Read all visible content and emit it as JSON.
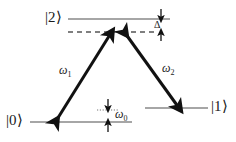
{
  "figure": {
    "type": "lambda-energy-level-diagram",
    "title": "",
    "background_color": "#ffffff",
    "ink_color": "#1a1a1a",
    "level_line_color": "#808080"
  },
  "levels": [
    {
      "id": "excited",
      "label": "|2⟩",
      "label_x": 47,
      "label_y": 11,
      "line_x1": 68,
      "line_x2": 170,
      "line_y": 19,
      "style": "solid"
    },
    {
      "id": "virtual",
      "label": "",
      "line_x1": 68,
      "line_x2": 158,
      "line_y": 32,
      "style": "dashed"
    },
    {
      "id": "ground0",
      "label": "|0⟩",
      "label_x": 7,
      "label_y": 114,
      "line_x1": 30,
      "line_x2": 132,
      "line_y": 122,
      "style": "solid"
    },
    {
      "id": "ground1",
      "label": "|1⟩",
      "label_x": 211,
      "label_y": 100,
      "line_x1": 145,
      "line_x2": 208,
      "line_y": 108,
      "style": "solid"
    },
    {
      "id": "ground0-reference",
      "label": "",
      "line_x1": 98,
      "line_x2": 118,
      "line_y": 110,
      "style": "dotted"
    }
  ],
  "transitions": [
    {
      "id": "omega1",
      "label": "ω",
      "subscript": "1",
      "label_x": 59,
      "label_y": 64,
      "from_x": 56,
      "from_y": 121,
      "to_x": 111,
      "to_y": 33,
      "arrowheads": "both",
      "width": 3
    },
    {
      "id": "omega2",
      "label": "ω",
      "subscript": "2",
      "label_x": 162,
      "label_y": 62,
      "from_x": 125,
      "from_y": 33,
      "to_x": 179,
      "to_y": 108,
      "arrowheads": "both",
      "width": 3
    }
  ],
  "measures": [
    {
      "id": "detuning",
      "label": "Δ",
      "label_x": 155,
      "label_y": 21,
      "arrow_x": 161,
      "arrow_top_y": 10,
      "arrow_bottom_y": 41,
      "gap_top_y": 20,
      "gap_bottom_y": 31,
      "description": "one-photon detuning between |2⟩ and the virtual level"
    },
    {
      "id": "ground-splitting",
      "label": "ω",
      "subscript": "0",
      "label_x": 115,
      "label_y": 108,
      "arrow_x": 108,
      "arrow_top_y": 100,
      "arrow_bottom_y": 131,
      "gap_top_y": 109,
      "gap_bottom_y": 121,
      "description": "ground-state splitting between |0⟩ and |1⟩"
    }
  ]
}
